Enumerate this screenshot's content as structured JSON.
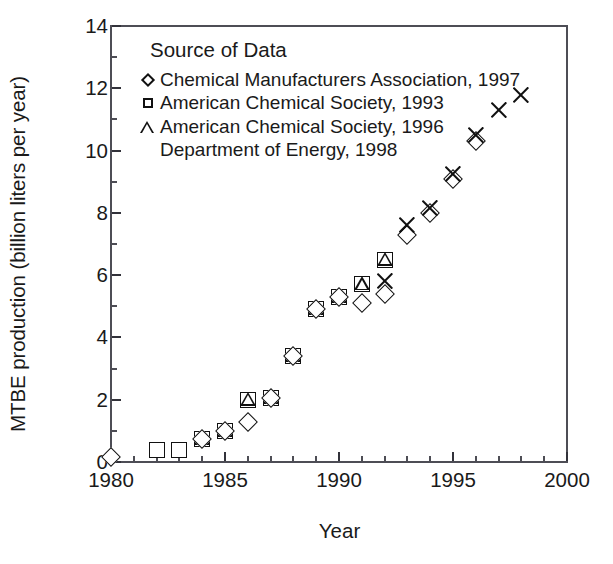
{
  "chart_data": {
    "type": "scatter",
    "title": "",
    "xlabel": "Year",
    "ylabel": "MTBE production (billion liters per year)",
    "xlim": [
      1980,
      2000
    ],
    "ylim": [
      0,
      14
    ],
    "xticks": [
      1980,
      1985,
      1990,
      1995,
      2000
    ],
    "yticks": [
      0,
      2,
      4,
      6,
      8,
      10,
      12,
      14
    ],
    "xtick_labels": [
      "1980",
      "1985",
      "1990",
      "1995",
      "2000"
    ],
    "ytick_labels": [
      "0",
      "2",
      "4",
      "6",
      "8",
      "10",
      "12",
      "14"
    ],
    "x_minor_tick_step": 1,
    "y_minor_tick_step": 1,
    "grid": false,
    "legend_position": "upper-left-inside",
    "legend_title": "Source of Data",
    "series": [
      {
        "name": "Chemical Manufacturers Association, 1997",
        "marker": "diamond",
        "points": [
          {
            "x": 1980,
            "y": 0.15
          },
          {
            "x": 1984,
            "y": 0.75
          },
          {
            "x": 1985,
            "y": 1.0
          },
          {
            "x": 1986,
            "y": 1.3
          },
          {
            "x": 1987,
            "y": 2.05
          },
          {
            "x": 1988,
            "y": 3.4
          },
          {
            "x": 1989,
            "y": 4.9
          },
          {
            "x": 1990,
            "y": 5.3
          },
          {
            "x": 1991,
            "y": 5.1
          },
          {
            "x": 1992,
            "y": 5.4
          },
          {
            "x": 1993,
            "y": 7.3
          },
          {
            "x": 1994,
            "y": 8.0
          },
          {
            "x": 1995,
            "y": 9.1
          },
          {
            "x": 1996,
            "y": 10.3
          }
        ]
      },
      {
        "name": "American Chemical Society, 1993",
        "marker": "square",
        "points": [
          {
            "x": 1982,
            "y": 0.4
          },
          {
            "x": 1983,
            "y": 0.4
          },
          {
            "x": 1984,
            "y": 0.75
          },
          {
            "x": 1985,
            "y": 1.0
          },
          {
            "x": 1986,
            "y": 2.0
          },
          {
            "x": 1987,
            "y": 2.05
          },
          {
            "x": 1988,
            "y": 3.4
          },
          {
            "x": 1989,
            "y": 4.9
          },
          {
            "x": 1990,
            "y": 5.3
          },
          {
            "x": 1991,
            "y": 5.7
          },
          {
            "x": 1992,
            "y": 6.5
          }
        ]
      },
      {
        "name": "American Chemical Society, 1996",
        "marker": "triangle",
        "points": [
          {
            "x": 1984,
            "y": 0.75
          },
          {
            "x": 1985,
            "y": 1.0
          },
          {
            "x": 1986,
            "y": 2.0
          },
          {
            "x": 1987,
            "y": 2.05
          },
          {
            "x": 1988,
            "y": 3.4
          },
          {
            "x": 1989,
            "y": 4.9
          },
          {
            "x": 1990,
            "y": 5.3
          },
          {
            "x": 1991,
            "y": 5.7
          },
          {
            "x": 1992,
            "y": 6.5
          }
        ]
      },
      {
        "name": "Department of Energy, 1998",
        "marker": "cross",
        "points": [
          {
            "x": 1992,
            "y": 5.8
          },
          {
            "x": 1993,
            "y": 7.6
          },
          {
            "x": 1994,
            "y": 8.15
          },
          {
            "x": 1995,
            "y": 9.25
          },
          {
            "x": 1996,
            "y": 10.5
          },
          {
            "x": 1997,
            "y": 11.3
          },
          {
            "x": 1998,
            "y": 11.8
          }
        ]
      }
    ]
  },
  "legend": {
    "title": "Source of Data",
    "entries": [
      {
        "marker": "diamond",
        "label": "Chemical Manufacturers Association, 1997"
      },
      {
        "marker": "square",
        "label": "American Chemical Society, 1993"
      },
      {
        "marker": "triangle",
        "label": "American Chemical Society, 1996"
      },
      {
        "marker": "cross",
        "label": "Department of Energy, 1998"
      }
    ]
  },
  "colors": {
    "marker": "#111111",
    "axis": "#4d4d55",
    "background": "#ffffff",
    "text": "#1a1a1a"
  }
}
